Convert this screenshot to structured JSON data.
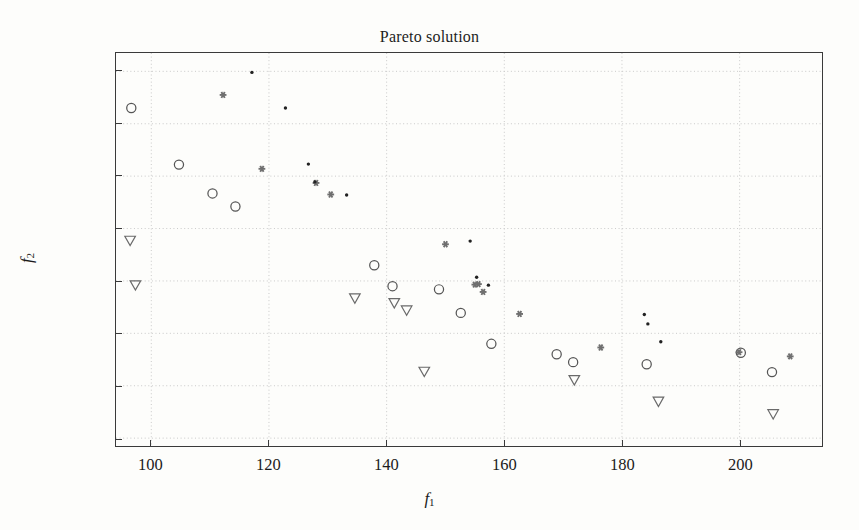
{
  "chart_data": {
    "type": "scatter",
    "title": "Pareto solution",
    "xlabel": "f1",
    "ylabel": "f2",
    "xlabel_base": "f",
    "xlabel_sub": "1",
    "ylabel_base": "f",
    "ylabel_sub": "2",
    "xlim": [
      94,
      214
    ],
    "ylim": [
      28.5,
      103.5
    ],
    "xticks": [
      100,
      120,
      140,
      160,
      180,
      200
    ],
    "yticks": [
      30,
      40,
      50,
      60,
      70,
      80,
      90,
      100
    ],
    "grid": true,
    "grid_style": "dotted",
    "grid_color": "#c9c9c9",
    "legend": "none",
    "frame_color": "#3a3a3a",
    "background": "#fdfdfb",
    "series": [
      {
        "name": "circle-series",
        "marker": "circle-open",
        "color": "#555555",
        "points": [
          [
            96.6,
            93.0
          ],
          [
            104.7,
            82.2
          ],
          [
            110.4,
            76.7
          ],
          [
            114.3,
            74.2
          ],
          [
            137.9,
            63.0
          ],
          [
            141.0,
            59.0
          ],
          [
            148.9,
            58.4
          ],
          [
            152.6,
            53.9
          ],
          [
            157.8,
            48.0
          ],
          [
            168.9,
            46.0
          ],
          [
            171.7,
            44.5
          ],
          [
            184.2,
            44.1
          ],
          [
            200.2,
            46.3
          ],
          [
            205.5,
            42.6
          ]
        ]
      },
      {
        "name": "triangle-series",
        "marker": "triangle-down-open",
        "color": "#6a6a6a",
        "points": [
          [
            96.4,
            67.7
          ],
          [
            97.3,
            59.2
          ],
          [
            134.6,
            56.7
          ],
          [
            141.3,
            55.8
          ],
          [
            143.4,
            54.4
          ],
          [
            146.4,
            42.7
          ],
          [
            171.9,
            41.1
          ],
          [
            186.2,
            37.0
          ],
          [
            205.7,
            34.6
          ]
        ]
      },
      {
        "name": "asterisk-series",
        "marker": "asterisk",
        "color": "#6f6f6f",
        "points": [
          [
            112.2,
            95.5
          ],
          [
            118.8,
            81.4
          ],
          [
            128.0,
            78.7
          ],
          [
            130.5,
            76.5
          ],
          [
            150.0,
            67.0
          ],
          [
            155.0,
            59.3
          ],
          [
            155.6,
            59.4
          ],
          [
            156.4,
            57.9
          ],
          [
            162.6,
            53.7
          ],
          [
            176.4,
            47.3
          ],
          [
            199.9,
            46.4
          ],
          [
            208.6,
            45.6
          ]
        ]
      },
      {
        "name": "dot-series",
        "marker": "dot",
        "color": "#222222",
        "points": [
          [
            117.1,
            99.8
          ],
          [
            122.8,
            93.0
          ],
          [
            126.7,
            82.3
          ],
          [
            127.8,
            78.9
          ],
          [
            133.2,
            76.4
          ],
          [
            154.2,
            67.6
          ],
          [
            155.3,
            60.7
          ],
          [
            157.3,
            59.2
          ],
          [
            183.8,
            53.6
          ],
          [
            184.4,
            51.8
          ],
          [
            186.6,
            48.4
          ]
        ]
      }
    ]
  }
}
